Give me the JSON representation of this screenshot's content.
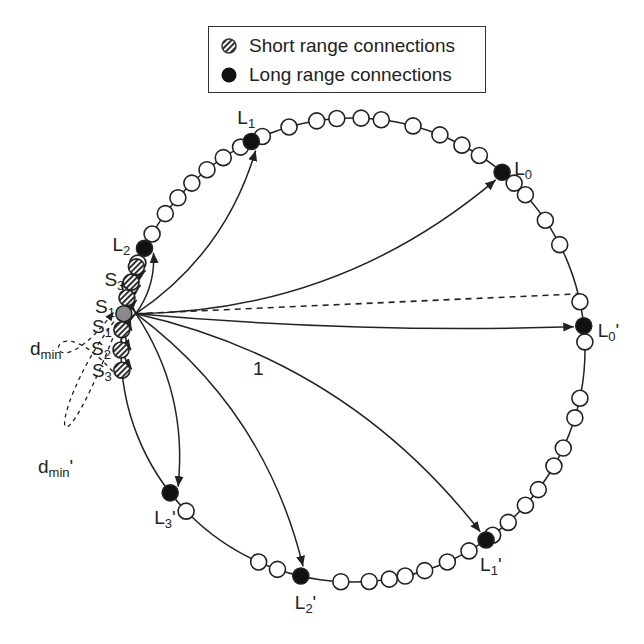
{
  "legend": {
    "items": [
      {
        "label": "Short range connections",
        "symbol": "hatched-circle"
      },
      {
        "label": "Long range connections",
        "symbol": "filled-circle"
      }
    ]
  },
  "diagram": {
    "type": "ring-network",
    "center": [
      353,
      350
    ],
    "radius": 232,
    "node_radius": 8,
    "source_node": {
      "angle": 171,
      "fill": "#8a8a8a"
    },
    "plain_node_angles": [
      164,
      158,
      150,
      144,
      139,
      134,
      129,
      124,
      119,
      113,
      106,
      99,
      94,
      88,
      83,
      75,
      68,
      62,
      57,
      46,
      42,
      34,
      27,
      12,
      2,
      -12,
      -17,
      -25,
      -30,
      -37,
      -42,
      -48,
      -53,
      -60,
      -66,
      -72,
      -77,
      -81,
      -86,
      -93,
      -109,
      -114,
      -136
    ],
    "long_range_nodes": [
      {
        "id": "L0",
        "label": "L",
        "sub": "0",
        "prime": false,
        "angle": 50
      },
      {
        "id": "L1",
        "label": "L",
        "sub": "1",
        "prime": false,
        "angle": 116
      },
      {
        "id": "L2",
        "label": "L",
        "sub": "2",
        "prime": false,
        "angle": 154
      },
      {
        "id": "L0p",
        "label": "L",
        "sub": "0",
        "prime": true,
        "angle": 6
      },
      {
        "id": "L1p",
        "label": "L",
        "sub": "1",
        "prime": true,
        "angle": -55
      },
      {
        "id": "L2p",
        "label": "L",
        "sub": "2",
        "prime": true,
        "angle": -103
      },
      {
        "id": "L3p",
        "label": "L",
        "sub": "3",
        "prime": true,
        "angle": -142
      }
    ],
    "short_range_nodes": [
      {
        "id": "S1",
        "label": "S",
        "sub": "1",
        "angle": 175
      },
      {
        "id": "S2",
        "label": "S",
        "sub": "2",
        "angle": 180
      },
      {
        "id": "S3",
        "label": "S",
        "sub": "3",
        "angle": 185
      },
      {
        "id": "S1p",
        "label": "S",
        "sub": "1",
        "angle": 167
      },
      {
        "id": "S2p",
        "label": "S",
        "sub": "2",
        "angle": 163
      },
      {
        "id": "S3p",
        "label": "S",
        "sub": "3",
        "angle": 159
      }
    ],
    "distance_label": "1",
    "dmin_label": {
      "text": "d",
      "sub": "min"
    },
    "colors": {
      "line": "#222222",
      "node_fill": "#ffffff",
      "long_fill": "#111111",
      "source_fill": "#8a8a8a"
    }
  }
}
